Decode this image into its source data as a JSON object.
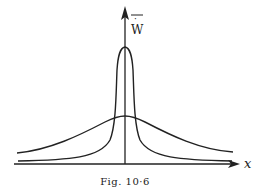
{
  "figure": {
    "caption": "Fig. 10·6",
    "y_axis_label": "W̄",
    "y_axis_dot": "·",
    "x_axis_label": "x",
    "curves": [
      {
        "name": "narrow-peaked-curve",
        "description": "tall narrow distribution centered on axis"
      },
      {
        "name": "broad-curve",
        "description": "low broad distribution centered on axis"
      }
    ]
  }
}
